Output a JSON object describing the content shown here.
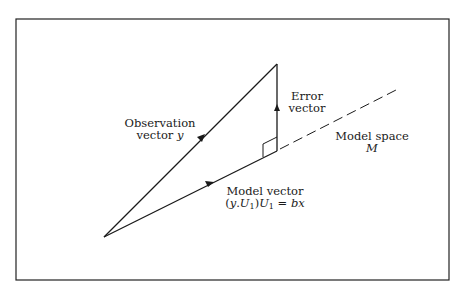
{
  "figure": {
    "frame": {
      "x": 16,
      "y": 19,
      "width": 433,
      "height": 261,
      "stroke": "#222222"
    },
    "points": {
      "origin": [
        104,
        237
      ],
      "observation_tip": [
        277,
        64
      ],
      "projection_foot": [
        277,
        151
      ],
      "model_space_end": [
        398,
        89
      ]
    },
    "labels": {
      "observation": {
        "line1": "Observation",
        "line2_text": "vector ",
        "line2_symbol": "y"
      },
      "error": {
        "line1": "Error",
        "line2": "vector"
      },
      "model_space": {
        "line1": "Model space",
        "line2_symbol": "M"
      },
      "model_vector": {
        "line1": "Model vector",
        "formula": {
          "open": "(",
          "y": "y",
          "dot": ".",
          "U": "U",
          "sub1": "1",
          "close": ")",
          "U2": "U",
          "sub2": "1",
          "eq": " = ",
          "b": "b",
          "x": "x"
        }
      }
    },
    "colors": {
      "ink": "#1a1a1a",
      "background": "#ffffff"
    }
  }
}
